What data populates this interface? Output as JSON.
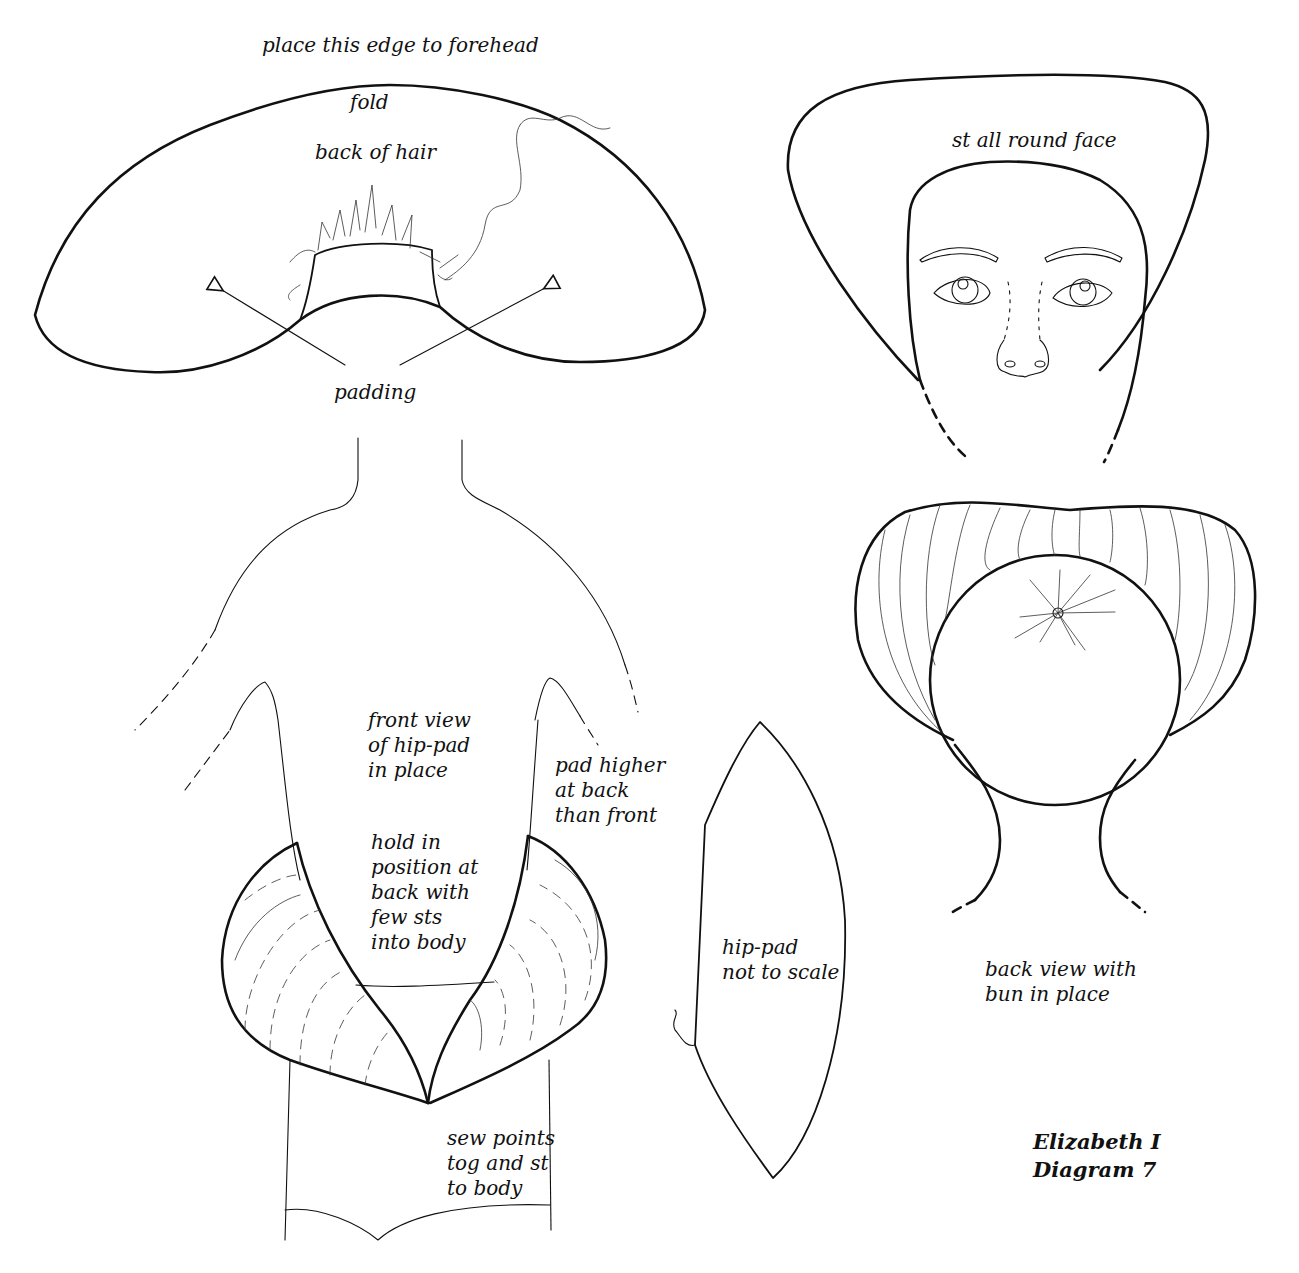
{
  "figure": {
    "title_line1": "Elizabeth I",
    "title_line2": "Diagram 7"
  },
  "hair_piece": {
    "edge_label": "place this edge to forehead",
    "fold_label": "fold",
    "back_label": "back of hair",
    "padding_label": "padding"
  },
  "face_view": {
    "label": "st all round face"
  },
  "front_body": {
    "front_view_label": "front view\nof hip-pad\nin place",
    "back_note": "pad higher\nat back\nthan front",
    "hold_note": "hold in\nposition at\nback with\nfew sts\ninto body",
    "sew_note": "sew points\ntog and st\nto body"
  },
  "hip_pad": {
    "label": "hip-pad\nnot to scale"
  },
  "back_view": {
    "label": "back view with\nbun in place"
  },
  "colors": {
    "ink": "#111111",
    "paper": "#ffffff"
  }
}
